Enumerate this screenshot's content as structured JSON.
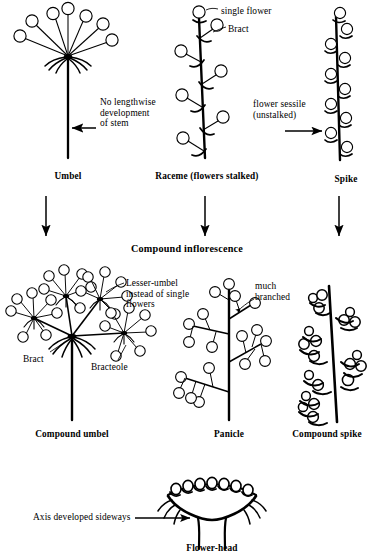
{
  "diagram": {
    "background_color": "#ffffff",
    "ink_color": "#000000",
    "section_title": "Compound inflorescence",
    "row1": {
      "umbel": {
        "caption": "Umbel",
        "annotation": "No lengthwise\ndevelopment\nof stem",
        "flower_count": 7,
        "structure": "simple-umbel"
      },
      "raceme": {
        "caption": "Raceme (flowers stalked)",
        "label_flower": "single flower",
        "label_bract": "Bract",
        "flower_count": 7,
        "structure": "raceme"
      },
      "spike": {
        "caption": "Spike",
        "annotation": "flower sessile\n(unstalked)",
        "flower_count": 9,
        "structure": "spike"
      }
    },
    "row2": {
      "compound_umbel": {
        "caption": "Compound umbel",
        "label_lesser_umbel": "Lesser-umbel\ninstead of single\nflowers",
        "label_bract": "Bract",
        "label_bracteole": "Bracteole",
        "lesser_umbel_count": 4,
        "structure": "compound-umbel"
      },
      "panicle": {
        "caption": "Panicle",
        "label_branched": "much\nbranched",
        "branch_count": 5,
        "structure": "panicle"
      },
      "compound_spike": {
        "caption": "Compound spike",
        "spikelet_count": 6,
        "structure": "compound-spike"
      }
    },
    "row3": {
      "flower_head": {
        "caption": "Flower-head",
        "annotation": "Axis developed sideways",
        "flower_count": 7,
        "structure": "capitulum"
      }
    },
    "arrows": {
      "down_count": 3,
      "left_arrow": "left",
      "right_arrow": "right"
    }
  }
}
